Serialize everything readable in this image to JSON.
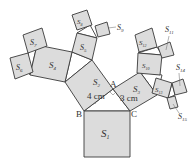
{
  "figure": {
    "type": "pythagoras-tree",
    "points": {
      "A": "A",
      "B": "B",
      "C": "C"
    },
    "lengths": {
      "AB": "4 cm",
      "AC": "3 cm"
    },
    "squares": [
      {
        "id": "S1",
        "label": "S",
        "sub": "1"
      },
      {
        "id": "S2",
        "label": "S",
        "sub": "2"
      },
      {
        "id": "S3",
        "label": "S",
        "sub": "3"
      },
      {
        "id": "S4",
        "label": "S",
        "sub": "4"
      },
      {
        "id": "S5",
        "label": "S",
        "sub": "5"
      },
      {
        "id": "S6",
        "label": "S",
        "sub": "6"
      },
      {
        "id": "S7",
        "label": "S",
        "sub": "7"
      },
      {
        "id": "S8",
        "label": "S",
        "sub": "8"
      },
      {
        "id": "S9",
        "label": "S",
        "sub": "9"
      },
      {
        "id": "S10",
        "label": "S",
        "sub": "10"
      },
      {
        "id": "S11",
        "label": "S",
        "sub": "11"
      },
      {
        "id": "S12",
        "label": "S",
        "sub": "12"
      },
      {
        "id": "S13",
        "label": "S",
        "sub": "13"
      },
      {
        "id": "S14",
        "label": "S",
        "sub": "14"
      },
      {
        "id": "S15",
        "label": "S",
        "sub": "15"
      }
    ]
  }
}
